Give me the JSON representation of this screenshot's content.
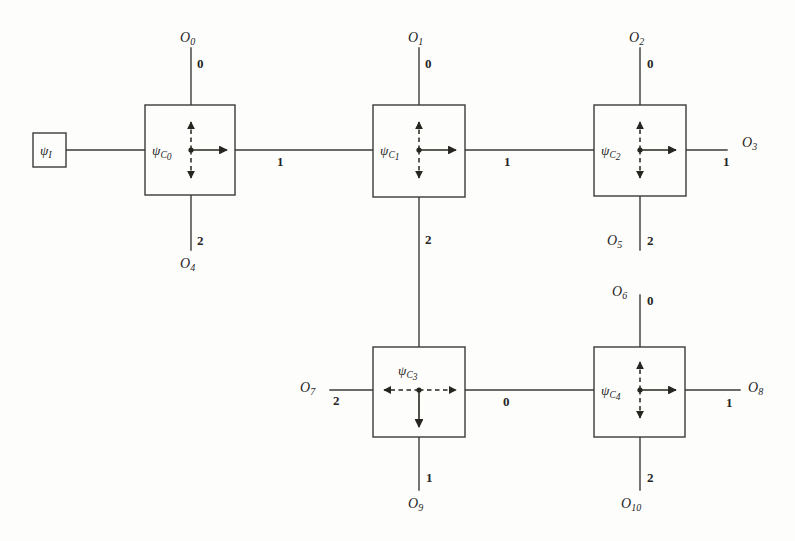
{
  "diagram": {
    "colors": {
      "ink": "#26251f",
      "wire": "#3a3a38",
      "background": "#fdfdfb"
    },
    "input_node": {
      "label_base": "ψ",
      "label_sub": "I",
      "name": "psi-I"
    },
    "nodes": [
      {
        "id": "c0",
        "label_base": "ψ",
        "label_sub": "C",
        "label_sub2": "0",
        "label_position": "left",
        "arrows": [
          "up-dashed",
          "down-dashed",
          "right-solid"
        ]
      },
      {
        "id": "c1",
        "label_base": "ψ",
        "label_sub": "C",
        "label_sub2": "1",
        "label_position": "left",
        "arrows": [
          "up-dashed",
          "down-dashed",
          "right-solid"
        ]
      },
      {
        "id": "c2",
        "label_base": "ψ",
        "label_sub": "C",
        "label_sub2": "2",
        "label_position": "left",
        "arrows": [
          "up-dashed",
          "down-dashed",
          "right-solid"
        ]
      },
      {
        "id": "c3",
        "label_base": "ψ",
        "label_sub": "C",
        "label_sub2": "3",
        "label_position": "top",
        "arrows": [
          "left-dashed",
          "right-dashed",
          "down-solid"
        ]
      },
      {
        "id": "c4",
        "label_base": "ψ",
        "label_sub": "C",
        "label_sub2": "4",
        "label_position": "left",
        "arrows": [
          "up-dashed",
          "down-dashed",
          "right-solid"
        ]
      }
    ],
    "outputs": [
      {
        "id": "o0",
        "base": "O",
        "sub": "0"
      },
      {
        "id": "o1",
        "base": "O",
        "sub": "1"
      },
      {
        "id": "o2",
        "base": "O",
        "sub": "2"
      },
      {
        "id": "o3",
        "base": "O",
        "sub": "3"
      },
      {
        "id": "o4",
        "base": "O",
        "sub": "4"
      },
      {
        "id": "o5",
        "base": "O",
        "sub": "5"
      },
      {
        "id": "o6",
        "base": "O",
        "sub": "6"
      },
      {
        "id": "o7",
        "base": "O",
        "sub": "7"
      },
      {
        "id": "o8",
        "base": "O",
        "sub": "8"
      },
      {
        "id": "o9",
        "base": "O",
        "sub": "9"
      },
      {
        "id": "o10",
        "base": "O",
        "sub": "10"
      }
    ],
    "leg_indices": {
      "c0_up": "0",
      "c0_down": "2",
      "c0_right": "1",
      "c1_up": "0",
      "c1_down": "2",
      "c1_right": "1",
      "c2_up": "0",
      "c2_down": "2",
      "c2_right": "1",
      "c3_left": "2",
      "c3_right": "0",
      "c3_down": "1",
      "c4_up": "0",
      "c4_down": "2",
      "c4_right": "1"
    }
  }
}
